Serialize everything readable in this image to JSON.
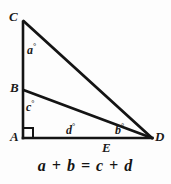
{
  "figure": {
    "background_color": "#fdfdfd",
    "stroke_color": "#141414",
    "vertices": [
      {
        "id": "C",
        "label": "C",
        "x": 23,
        "y": 22
      },
      {
        "id": "B",
        "label": "B",
        "x": 23,
        "y": 90
      },
      {
        "id": "A",
        "label": "A",
        "x": 23,
        "y": 138
      },
      {
        "id": "E",
        "label": "E",
        "x": 107,
        "y": 138
      },
      {
        "id": "D",
        "label": "D",
        "x": 152,
        "y": 138
      }
    ],
    "segments": [
      {
        "name": "segment-CA",
        "from": "C",
        "to": "A"
      },
      {
        "name": "segment-CD",
        "from": "C",
        "to": "D"
      },
      {
        "name": "segment-AD",
        "from": "A",
        "to": "D"
      },
      {
        "name": "segment-BD",
        "from": "B",
        "to": "D"
      }
    ],
    "right_angle": {
      "at": "A",
      "marker": "square"
    },
    "angles": [
      {
        "id": "a",
        "label": "a",
        "degree_symbol": "°",
        "at_vertex": "C"
      },
      {
        "id": "c",
        "label": "c",
        "degree_symbol": "°",
        "at_vertex": "B"
      },
      {
        "id": "d",
        "label": "d",
        "degree_symbol": "°",
        "at_vertex": "E"
      },
      {
        "id": "b",
        "label": "b",
        "degree_symbol": "°",
        "at_vertex": "D"
      }
    ],
    "equation": "a + b = c + d"
  }
}
